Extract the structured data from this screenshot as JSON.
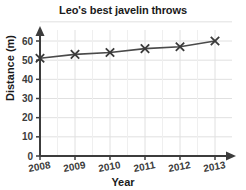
{
  "chart_data": {
    "type": "line",
    "title": "Leo's best javelin throws",
    "xlabel": "Year",
    "ylabel": "Distance (m)",
    "categories": [
      "2008",
      "2009",
      "2010",
      "2011",
      "2012",
      "2013"
    ],
    "x": [
      2008,
      2009,
      2010,
      2011,
      2012,
      2013
    ],
    "values": [
      51,
      53,
      54,
      56,
      57,
      60
    ],
    "series": [
      {
        "name": "Best javelin throw",
        "values": [
          51,
          53,
          54,
          56,
          57,
          60
        ]
      }
    ],
    "xlim": [
      2008,
      2013
    ],
    "ylim": [
      0,
      65
    ],
    "ytick_labels": [
      "0",
      "10",
      "20",
      "30",
      "40",
      "50",
      "60"
    ],
    "yticks": [
      0,
      10,
      20,
      30,
      40,
      50,
      60
    ],
    "xtick_labels": [
      "2008",
      "2009",
      "2010",
      "2011",
      "2012",
      "2013"
    ],
    "grid": true,
    "legend": false,
    "marker": "x",
    "line_color": "#4a4a4a",
    "marker_color": "#3a3a3a",
    "grid_color": "#e0e0e0",
    "axis_color": "#3c3c3c",
    "text_color": "#1a1a1a"
  }
}
